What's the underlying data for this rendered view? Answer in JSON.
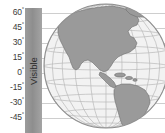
{
  "axis": {
    "name": "latitude-axis",
    "unit": "degrees",
    "ticks": [
      {
        "label": "60",
        "degree_symbol": "°",
        "value": 60,
        "y": 13
      },
      {
        "label": "45",
        "degree_symbol": "°",
        "value": 45,
        "y": 28
      },
      {
        "label": "30",
        "degree_symbol": "°",
        "value": 30,
        "y": 43
      },
      {
        "label": "15",
        "degree_symbol": "°",
        "value": 15,
        "y": 58
      },
      {
        "label": "0",
        "degree_symbol": "°",
        "value": 0,
        "y": 73
      },
      {
        "label": "-15",
        "degree_symbol": "°",
        "value": -15,
        "y": 88
      },
      {
        "label": "-30",
        "degree_symbol": "°",
        "value": -30,
        "y": 103
      },
      {
        "label": "-45",
        "degree_symbol": "°",
        "value": -45,
        "y": 118
      }
    ]
  },
  "band": {
    "label": "Visible",
    "color": "#9c9c9c",
    "orientation": "vertical"
  },
  "globe": {
    "name": "earth-globe",
    "projection": "orthographic",
    "region": "Americas",
    "land_color": "#9a9a9a",
    "ocean_color": "#f2f2f2",
    "graticule_color": "#b9b9b9",
    "graticule_spacing_degrees": 15
  },
  "chart_data": {
    "type": "map",
    "title": "",
    "ylabel": "",
    "ytick_labels": [
      "60°",
      "45°",
      "30°",
      "15°",
      "0°",
      "-15°",
      "-30°",
      "-45°"
    ],
    "ytick_values": [
      60,
      45,
      30,
      15,
      0,
      -15,
      -30,
      -45
    ],
    "ylim": [
      -52,
      67
    ],
    "grid": true,
    "legend": [
      "Visible"
    ],
    "legend_position": "left-vertical-band"
  }
}
